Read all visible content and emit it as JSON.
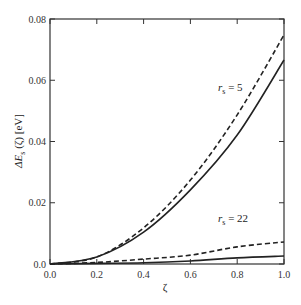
{
  "chart_data": {
    "type": "line",
    "title": "",
    "xlabel": "ζ",
    "ylabel": "ΔE_s (ζ) [eV]",
    "xlim": [
      0.0,
      1.0
    ],
    "ylim": [
      0.0,
      0.08
    ],
    "grid": false,
    "legend": "none (curves annotated inline)",
    "x_ticks": [
      "0.0",
      "0.2",
      "0.4",
      "0.6",
      "0.8",
      "1.0"
    ],
    "y_ticks": [
      "0.0",
      "0.02",
      "0.04",
      "0.06",
      "0.08"
    ],
    "x": [
      0.0,
      0.2,
      0.4,
      0.6,
      0.8,
      1.0
    ],
    "series": [
      {
        "name": "r_s = 5 (dashed)",
        "style": "dashed",
        "group": "rs5",
        "values": [
          0.0,
          0.0023,
          0.0118,
          0.0274,
          0.0487,
          0.0748
        ]
      },
      {
        "name": "r_s = 5 (solid)",
        "style": "solid",
        "group": "rs5",
        "values": [
          0.0,
          0.0023,
          0.0104,
          0.0242,
          0.0421,
          0.0666
        ]
      },
      {
        "name": "r_s = 22 (dashed)",
        "style": "dashed",
        "group": "rs22",
        "values": [
          0.0,
          0.0005,
          0.0016,
          0.0029,
          0.0056,
          0.0072
        ]
      },
      {
        "name": "r_s = 22 (solid)",
        "style": "solid",
        "group": "rs22",
        "values": [
          0.0,
          0.0002,
          0.0004,
          0.001,
          0.002,
          0.0026
        ]
      }
    ],
    "annotations": [
      {
        "text_main": "r",
        "text_sub": "s",
        "text_rest": " = 5",
        "x": 0.74,
        "y": 0.057
      },
      {
        "text_main": "r",
        "text_sub": "s",
        "text_rest": " = 22",
        "x": 0.74,
        "y": 0.0155
      }
    ]
  },
  "labels": {
    "xlabel": "ζ",
    "ylabel_delta": "ΔE",
    "ylabel_sub": "s",
    "ylabel_rest": " (ζ) [eV]",
    "rs5_r": "r",
    "rs5_sub": "s",
    "rs5_rest": " = 5",
    "rs22_r": "r",
    "rs22_sub": "s",
    "rs22_rest": " = 22"
  },
  "colors": {
    "line": "#222222",
    "axis": "#333333"
  }
}
